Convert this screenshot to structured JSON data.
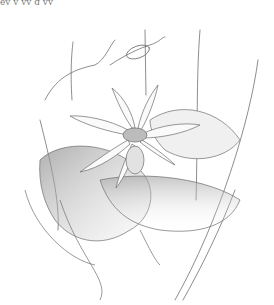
{
  "image": {
    "subject": "Pencil botanical illustration of a flowering plant with radiating narrow petals, large serrated holly-like leaves, and thin climbing stems with tendrils",
    "style": "graphite pencil sketch on white",
    "top_text_fragment": "ey y yy  g  yy ",
    "colors": {
      "background": "#ffffff",
      "line": "#6f6f6f",
      "shade_dark": "#9a9a9a",
      "shade_light": "#d9d9d9"
    }
  }
}
